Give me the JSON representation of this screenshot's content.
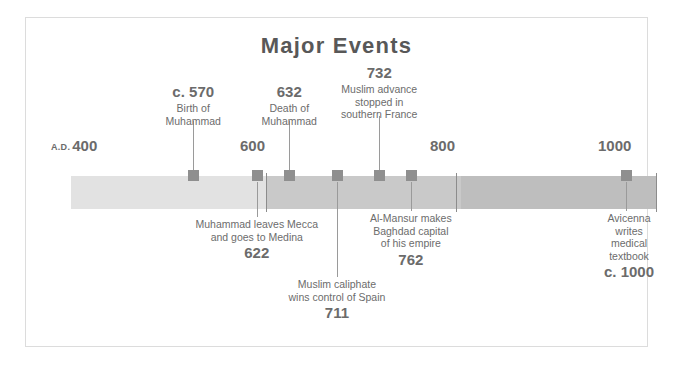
{
  "title": "Major Events",
  "colors": {
    "frame_border": "#dcdcdc",
    "segment_light": "#e2e2e2",
    "segment_mid": "#c9c9c9",
    "segment_dark": "#bebebe",
    "marker": "#8f8f8f",
    "leader": "#9a9a9a",
    "text": "#6c6c6c",
    "title": "#585858"
  },
  "axis": {
    "start_year": 400,
    "end_year": 1000,
    "ticks": [
      {
        "label": "400",
        "prefix": "A.D.",
        "year": 400,
        "x": 45
      },
      {
        "label": "600",
        "prefix": "",
        "year": 600,
        "x": 240
      },
      {
        "label": "800",
        "prefix": "",
        "year": 800,
        "x": 430
      },
      {
        "label": "1000",
        "prefix": "",
        "year": 1000,
        "x": 630
      }
    ],
    "segments": [
      {
        "name": "400-600",
        "from": 400,
        "to": 600,
        "color": "#e2e2e2"
      },
      {
        "name": "600-800",
        "from": 600,
        "to": 800,
        "color": "#c9c9c9"
      },
      {
        "name": "800-1000",
        "from": 800,
        "to": 1000,
        "color": "#bebebe"
      }
    ]
  },
  "events_above": [
    {
      "year": "c. 570",
      "desc_lines": [
        "Birth of",
        "Muhammad"
      ],
      "marker_x": 192,
      "label_x": 192,
      "label_top": 82,
      "leader_top": 120,
      "leader_height": 49
    },
    {
      "year": "632",
      "desc_lines": [
        "Death of",
        "Muhammad"
      ],
      "marker_x": 288,
      "label_x": 288,
      "label_top": 82,
      "leader_top": 120,
      "leader_height": 49
    },
    {
      "year": "732",
      "desc_lines": [
        "Muslim advance",
        "stopped in",
        "southern France"
      ],
      "marker_x": 378,
      "label_x": 378,
      "label_top": 63,
      "leader_top": 115,
      "leader_height": 54
    }
  ],
  "events_below": [
    {
      "year": "622",
      "desc_lines": [
        "Muhammad leaves Mecca",
        "and goes to Medina"
      ],
      "marker_x": 256,
      "label_x": 256,
      "label_top": 217,
      "leader_top": 181,
      "leader_height": 35
    },
    {
      "year": "711",
      "desc_lines": [
        "Muslim caliphate",
        "wins control of Spain"
      ],
      "marker_x": 336,
      "label_x": 336,
      "label_top": 277,
      "leader_top": 181,
      "leader_height": 95
    },
    {
      "year": "762",
      "desc_lines": [
        "Al-Mansur makes",
        "Baghdad capital",
        "of his empire"
      ],
      "marker_x": 410,
      "label_x": 410,
      "label_top": 211,
      "leader_top": 181,
      "leader_height": 29
    },
    {
      "year": "c. 1000",
      "desc_lines": [
        "Avicenna",
        "writes",
        "medical",
        "textbook"
      ],
      "marker_x": 625,
      "label_x": 628,
      "label_top": 211,
      "leader_top": 181,
      "leader_height": 29
    }
  ]
}
